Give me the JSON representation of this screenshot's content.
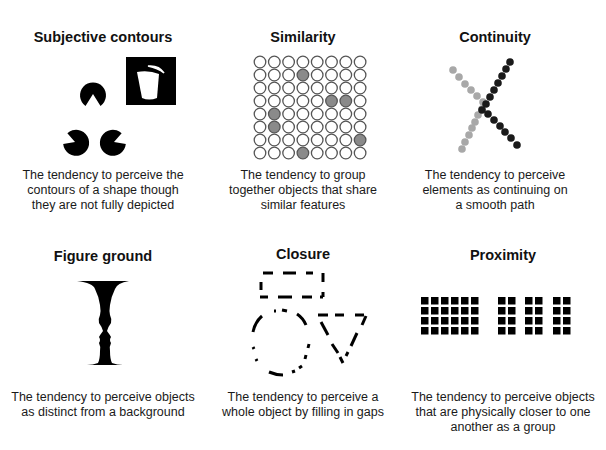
{
  "panels": [
    {
      "id": "subjective-contours",
      "title": "Subjective contours",
      "caption": [
        "The tendency to perceive the",
        "contours of a shape though",
        "they are not fully depicted"
      ]
    },
    {
      "id": "similarity",
      "title": "Similarity",
      "caption": [
        "The tendency to group",
        "together objects that share",
        "similar features"
      ],
      "grid": {
        "rows": 8,
        "cols": 8,
        "filled": [
          [
            1,
            3
          ],
          [
            3,
            5
          ],
          [
            3,
            6
          ],
          [
            4,
            1
          ],
          [
            5,
            1
          ],
          [
            6,
            7
          ],
          [
            7,
            3
          ]
        ],
        "fill_color": "#8a8a8a"
      }
    },
    {
      "id": "continuity",
      "title": "Continuity",
      "caption": [
        "The tendency to perceive",
        "elements as continuing on",
        "a smooth path"
      ],
      "colors": {
        "light": "#a8a8a8",
        "dark": "#1a1a1a"
      }
    },
    {
      "id": "figure-ground",
      "title": "Figure ground",
      "caption": [
        "The tendency to perceive objects",
        "as distinct from a background"
      ]
    },
    {
      "id": "closure",
      "title": "Closure",
      "caption": [
        "The tendency to perceive a",
        "whole object by filling in gaps"
      ]
    },
    {
      "id": "proximity",
      "title": "Proximity",
      "caption": [
        "The tendency to perceive objects",
        "that are physically closer to one",
        "another as a group"
      ],
      "groups": [
        {
          "cols": 6,
          "rows": 4
        },
        {
          "cols": 2,
          "rows": 4
        },
        {
          "cols": 2,
          "rows": 4
        },
        {
          "cols": 2,
          "rows": 4
        }
      ]
    }
  ]
}
